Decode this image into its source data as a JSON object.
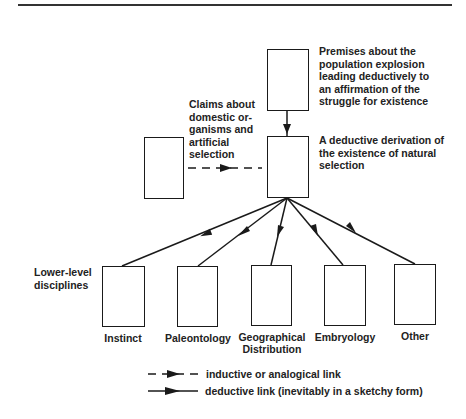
{
  "diagram": {
    "top_node": {
      "label_lines": [
        "Premises about the",
        "population explosion",
        "leading deductively to",
        "an affirmation of the",
        "struggle for existence"
      ]
    },
    "center_node": {
      "label_lines": [
        "A deductive derivation of",
        "the existence of natural",
        "selection"
      ]
    },
    "left_node": {
      "label_lines": [
        "Claims about",
        "domestic or-",
        "ganisms and",
        "artificial",
        "selection"
      ]
    },
    "lower_level": {
      "label_lines": [
        "Lower-level",
        "disciplines"
      ],
      "disciplines": [
        {
          "name": "Instinct"
        },
        {
          "name": "Paleontology"
        },
        {
          "name": "Geographical",
          "name2": "Distribution"
        },
        {
          "name": "Embryology"
        },
        {
          "name": "Other"
        }
      ]
    },
    "legend": {
      "inductive": "inductive or analogical link",
      "deductive": "deductive link (inevitably in a sketchy form)"
    },
    "colors": {
      "stroke": "#1a1a1a",
      "background": "#ffffff"
    }
  }
}
